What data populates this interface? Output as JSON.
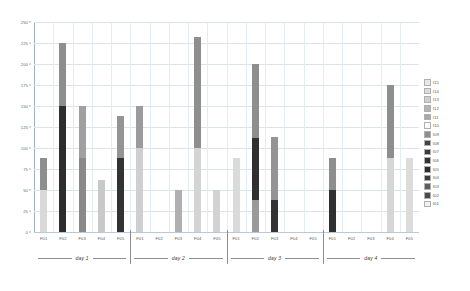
{
  "chart_data": {
    "type": "bar",
    "subtype": "stacked",
    "title": "",
    "xlabel": "",
    "ylabel": "",
    "ylim": [
      0,
      250
    ],
    "yticks": [
      0,
      25,
      50,
      75,
      100,
      125,
      150,
      175,
      200,
      225,
      250
    ],
    "ytick_labels": [
      "0",
      "25",
      "50",
      "75",
      "100",
      "125",
      "150",
      "175",
      "200",
      "225",
      "250"
    ],
    "grid": true,
    "legend_position": "right",
    "groups": [
      "day 1",
      "day 2",
      "day 3",
      "day 4"
    ],
    "categories": [
      "F01",
      "F02",
      "F03",
      "F04",
      "F05"
    ],
    "series": [
      {
        "name": "I01",
        "color": "#f2f2f2"
      },
      {
        "name": "I02",
        "color": "#4a4a4a"
      },
      {
        "name": "I03",
        "color": "#5e5e5e"
      },
      {
        "name": "I04",
        "color": "#3c3c3c"
      },
      {
        "name": "I05",
        "color": "#2e2e2e"
      },
      {
        "name": "I06",
        "color": "#333333"
      },
      {
        "name": "I07",
        "color": "#3a3a3a"
      },
      {
        "name": "I08",
        "color": "#434343"
      },
      {
        "name": "I09",
        "color": "#8e8e8e"
      },
      {
        "name": "I10",
        "color": "#fafafa"
      },
      {
        "name": "I11",
        "color": "#a8a8a8"
      },
      {
        "name": "I12",
        "color": "#b5b5b5"
      },
      {
        "name": "I13",
        "color": "#d0d0d0"
      },
      {
        "name": "I14",
        "color": "#dcdcdc"
      },
      {
        "name": "I15",
        "color": "#e8e8e8"
      }
    ],
    "bars": [
      {
        "group": "day 1",
        "category": "F01",
        "total": 88,
        "segments": [
          {
            "series": "I13",
            "value": 50,
            "color": "#d9d9d9"
          },
          {
            "series": "I09",
            "value": 38,
            "color": "#8e8e8e"
          }
        ]
      },
      {
        "group": "day 1",
        "category": "F02",
        "total": 225,
        "segments": [
          {
            "series": "I05",
            "value": 150,
            "color": "#2e2e2e"
          },
          {
            "series": "I09",
            "value": 75,
            "color": "#8e8e8e"
          }
        ]
      },
      {
        "group": "day 1",
        "category": "F03",
        "total": 150,
        "segments": [
          {
            "series": "I11",
            "value": 88,
            "color": "#8a8a8a"
          },
          {
            "series": "I09",
            "value": 62,
            "color": "#a0a0a0"
          }
        ]
      },
      {
        "group": "day 1",
        "category": "F04",
        "total": 62,
        "segments": [
          {
            "series": "I13",
            "value": 62,
            "color": "#c9c9c9"
          }
        ]
      },
      {
        "group": "day 1",
        "category": "F05",
        "total": 138,
        "segments": [
          {
            "series": "I05",
            "value": 88,
            "color": "#333333"
          },
          {
            "series": "I09",
            "value": 50,
            "color": "#949494"
          }
        ]
      },
      {
        "group": "day 2",
        "category": "F01",
        "total": 150,
        "segments": [
          {
            "series": "I13",
            "value": 100,
            "color": "#cfcfcf"
          },
          {
            "series": "I09",
            "value": 50,
            "color": "#9b9b9b"
          }
        ]
      },
      {
        "group": "day 2",
        "category": "F02",
        "total": 0,
        "segments": []
      },
      {
        "group": "day 2",
        "category": "F03",
        "total": 50,
        "segments": [
          {
            "series": "I11",
            "value": 50,
            "color": "#b0b0b0"
          }
        ]
      },
      {
        "group": "day 2",
        "category": "F04",
        "total": 232,
        "segments": [
          {
            "series": "I13",
            "value": 100,
            "color": "#d4d4d4"
          },
          {
            "series": "I09",
            "value": 132,
            "color": "#8e8e8e"
          }
        ]
      },
      {
        "group": "day 2",
        "category": "F05",
        "total": 50,
        "segments": [
          {
            "series": "I13",
            "value": 50,
            "color": "#d2d2d2"
          }
        ]
      },
      {
        "group": "day 3",
        "category": "F01",
        "total": 88,
        "segments": [
          {
            "series": "I13",
            "value": 88,
            "color": "#dadada"
          }
        ]
      },
      {
        "group": "day 3",
        "category": "F02",
        "total": 200,
        "segments": [
          {
            "series": "I11",
            "value": 38,
            "color": "#9a9a9a"
          },
          {
            "series": "I05",
            "value": 74,
            "color": "#303030"
          },
          {
            "series": "I09",
            "value": 88,
            "color": "#8e8e8e"
          }
        ]
      },
      {
        "group": "day 3",
        "category": "F03",
        "total": 113,
        "segments": [
          {
            "series": "I05",
            "value": 38,
            "color": "#333333"
          },
          {
            "series": "I09",
            "value": 75,
            "color": "#949494"
          }
        ]
      },
      {
        "group": "day 3",
        "category": "F04",
        "total": 0,
        "segments": []
      },
      {
        "group": "day 3",
        "category": "F05",
        "total": 0,
        "segments": []
      },
      {
        "group": "day 4",
        "category": "F01",
        "total": 88,
        "segments": [
          {
            "series": "I05",
            "value": 50,
            "color": "#303030"
          },
          {
            "series": "I09",
            "value": 38,
            "color": "#8e8e8e"
          }
        ]
      },
      {
        "group": "day 4",
        "category": "F02",
        "total": 0,
        "segments": []
      },
      {
        "group": "day 4",
        "category": "F03",
        "total": 0,
        "segments": []
      },
      {
        "group": "day 4",
        "category": "F04",
        "total": 175,
        "segments": [
          {
            "series": "I13",
            "value": 88,
            "color": "#d6d6d6"
          },
          {
            "series": "I09",
            "value": 87,
            "color": "#8e8e8e"
          }
        ]
      },
      {
        "group": "day 4",
        "category": "F05",
        "total": 88,
        "segments": [
          {
            "series": "I13",
            "value": 88,
            "color": "#dcdcdc"
          }
        ]
      }
    ]
  }
}
